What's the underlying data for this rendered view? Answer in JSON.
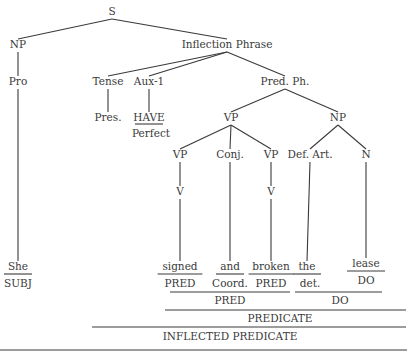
{
  "diagram": {
    "type": "syntax-tree",
    "nodes": [
      {
        "id": "S",
        "label": "S",
        "x": 112,
        "y": 15
      },
      {
        "id": "NP1",
        "label": "NP",
        "x": 18,
        "y": 48
      },
      {
        "id": "IP",
        "label": "Inflection Phrase",
        "x": 227,
        "y": 48
      },
      {
        "id": "Pro",
        "label": "Pro",
        "x": 18,
        "y": 85
      },
      {
        "id": "Tense",
        "label": "Tense",
        "x": 108,
        "y": 85
      },
      {
        "id": "Aux1",
        "label": "Aux-1",
        "x": 149,
        "y": 85
      },
      {
        "id": "PredPh",
        "label": "Pred. Ph.",
        "x": 285,
        "y": 85
      },
      {
        "id": "Pres",
        "label": "Pres.",
        "x": 108,
        "y": 121
      },
      {
        "id": "HAVE",
        "label": "HAVE",
        "x": 149,
        "y": 121
      },
      {
        "id": "Perfect",
        "label": "Perfect",
        "x": 151,
        "y": 137
      },
      {
        "id": "VP1",
        "label": "VP",
        "x": 231,
        "y": 121
      },
      {
        "id": "NP2",
        "label": "NP",
        "x": 338,
        "y": 121
      },
      {
        "id": "VP2",
        "label": "VP",
        "x": 180,
        "y": 158
      },
      {
        "id": "Conj",
        "label": "Conj.",
        "x": 230,
        "y": 158
      },
      {
        "id": "VP3",
        "label": "VP",
        "x": 271,
        "y": 158
      },
      {
        "id": "DefArt",
        "label": "Def. Art.",
        "x": 310,
        "y": 158
      },
      {
        "id": "N",
        "label": "N",
        "x": 366,
        "y": 158
      },
      {
        "id": "V1",
        "label": "V",
        "x": 180,
        "y": 195
      },
      {
        "id": "V2",
        "label": "V",
        "x": 271,
        "y": 195
      }
    ],
    "edges": [
      [
        "S",
        "NP1"
      ],
      [
        "S",
        "IP"
      ],
      [
        "NP1",
        "Pro"
      ],
      [
        "IP",
        "Tense"
      ],
      [
        "IP",
        "Aux1"
      ],
      [
        "IP",
        "PredPh"
      ],
      [
        "Tense",
        "Pres"
      ],
      [
        "Aux1",
        "HAVE"
      ],
      [
        "PredPh",
        "VP1"
      ],
      [
        "PredPh",
        "NP2"
      ],
      [
        "VP1",
        "VP2"
      ],
      [
        "VP1",
        "Conj"
      ],
      [
        "VP1",
        "VP3"
      ],
      [
        "NP2",
        "DefArt"
      ],
      [
        "NP2",
        "N"
      ],
      [
        "VP2",
        "V1"
      ],
      [
        "VP3",
        "V2"
      ]
    ],
    "leaves": [
      {
        "word": "She",
        "role": "SUBJ",
        "parent": "Pro",
        "x": 18,
        "y": 270
      },
      {
        "word": "signed",
        "role": "PRED",
        "parent": "V1",
        "x": 180,
        "y": 270
      },
      {
        "word": "and",
        "role": "Coord.",
        "parent": "Conj",
        "x": 230,
        "y": 270
      },
      {
        "word": "broken",
        "role": "PRED",
        "parent": "V2",
        "x": 271,
        "y": 270
      },
      {
        "word": "the",
        "role": "det.",
        "parent": "DefArt",
        "x": 307,
        "y": 270
      },
      {
        "word": "lease",
        "role": "DO",
        "parent": "N",
        "x": 366,
        "y": 267
      }
    ],
    "brackets": [
      {
        "label": "PRED",
        "x1": 170,
        "x2": 290,
        "line_y": 292,
        "text_y": 304
      },
      {
        "label": "DO",
        "x1": 295,
        "x2": 382,
        "line_y": 292,
        "text_y": 304
      },
      {
        "label": "PREDICATE",
        "x1": 165,
        "x2": 406,
        "line_y": 310,
        "text_y": 322
      },
      {
        "label": "INFLECTED PREDICATE",
        "x1": 92,
        "x2": 406,
        "line_y": 327,
        "text_y": 340
      }
    ],
    "bottom_rule": {
      "x1": 0,
      "x2": 407,
      "y": 350
    }
  }
}
